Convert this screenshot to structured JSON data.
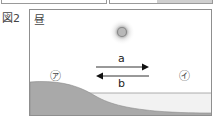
{
  "previous_figure": {
    "boxes": [
      {
        "position": "left",
        "fill": "#ffffff"
      },
      {
        "position": "right",
        "fill": "#cfcfcf"
      }
    ]
  },
  "figure": {
    "label": "図2",
    "title": "昼",
    "sun": {
      "label": "",
      "color": "#a8a8a8"
    },
    "arrows": [
      {
        "label": "a",
        "direction": "right"
      },
      {
        "label": "b",
        "direction": "left"
      }
    ],
    "points": [
      {
        "label": "㋐",
        "position": "land"
      },
      {
        "label": "㋑",
        "position": "sea"
      }
    ],
    "colors": {
      "land": "#a9a9a9",
      "sea": "#f2f2f2",
      "frame": "#8f8f8f",
      "arrow": "#222222"
    }
  }
}
